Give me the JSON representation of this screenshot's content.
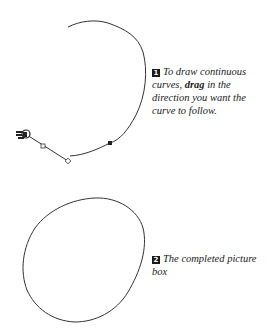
{
  "step1": {
    "number": "1",
    "text_before": "To draw continuous curves, ",
    "bold": "drag",
    "text_after": " in the direction you want the curve to follow."
  },
  "step2": {
    "number": "2",
    "text": "The completed picture box"
  },
  "icons": {
    "cursor": "pointing-hand-cursor-icon",
    "anchor_point": "filled-square-anchor",
    "handle_point": "hollow-diamond-handle"
  },
  "colors": {
    "stroke": "#333333",
    "badge": "#1a1a1a",
    "text": "#222222"
  }
}
